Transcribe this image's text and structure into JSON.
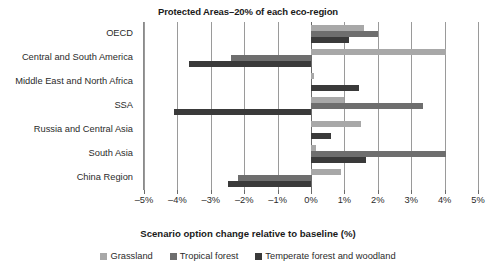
{
  "chart_data": {
    "type": "bar",
    "orientation": "horizontal",
    "title": "Protected Areas–20% of each eco-region",
    "xlabel": "Scenario option change relative to baseline (%)",
    "ylabel": "",
    "xlim": [
      -5,
      5
    ],
    "xticks": [
      -5,
      -4,
      -3,
      -2,
      -1,
      0,
      1,
      2,
      3,
      4,
      5
    ],
    "xtick_labels": [
      "–5%",
      "–4%",
      "–3%",
      "–2%",
      "–1%",
      "0%",
      "1%",
      "2%",
      "3%",
      "4%",
      "5%"
    ],
    "grid": true,
    "legend_position": "bottom",
    "categories": [
      "OECD",
      "Central and South America",
      "Middle East and North Africa",
      "SSA",
      "Russia and Central Asia",
      "South Asia",
      "China Region"
    ],
    "series": [
      {
        "name": "Grassland",
        "color": "#a8a8a8",
        "values": [
          1.6,
          4.05,
          0.1,
          1.0,
          1.5,
          0.15,
          0.9
        ]
      },
      {
        "name": "Tropical forest",
        "color": "#6e6e6e",
        "values": [
          2.0,
          -2.4,
          0.0,
          3.35,
          0.0,
          4.05,
          -2.2
        ]
      },
      {
        "name": "Temperate forest and woodland",
        "color": "#3a3a3a",
        "values": [
          1.15,
          -3.65,
          1.45,
          -4.1,
          0.6,
          1.65,
          -2.5
        ]
      }
    ]
  },
  "legend": {
    "items": [
      {
        "label": "Grassland",
        "color": "#a8a8a8"
      },
      {
        "label": "Tropical forest",
        "color": "#6e6e6e"
      },
      {
        "label": "Temperate forest and woodland",
        "color": "#3a3a3a"
      }
    ]
  },
  "colors": {
    "grassland": "#a8a8a8",
    "tropical_forest": "#6e6e6e",
    "temperate_forest": "#3a3a3a",
    "gridline": "#9a9a9a",
    "axis": "#6b6b6b",
    "text": "#2b2b2b"
  }
}
